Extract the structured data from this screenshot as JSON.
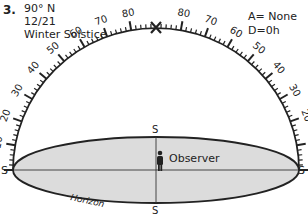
{
  "problem": {
    "number": "3.",
    "latitude": "90° N",
    "date": "12/21",
    "event": "Winter Solstice"
  },
  "parameters": {
    "azimuth": "A= None",
    "declination": "D=0h"
  },
  "diagram": {
    "altitude_scale_left": [
      "0",
      "10",
      "20",
      "30",
      "40",
      "50",
      "60",
      "70",
      "80",
      "90"
    ],
    "altitude_scale_right": [
      "80",
      "70",
      "60",
      "50",
      "40",
      "30",
      "20",
      "10",
      "0"
    ],
    "top_label": "90",
    "left_direction": "S",
    "right_direction": "S",
    "top_direction": "S",
    "bottom_direction": "S",
    "observer_label": "Observer",
    "horizon_label": "Horizon",
    "sun_marker": "X",
    "colors": {
      "horizon_fill": "#dcdcdc",
      "line": "#222222"
    }
  }
}
